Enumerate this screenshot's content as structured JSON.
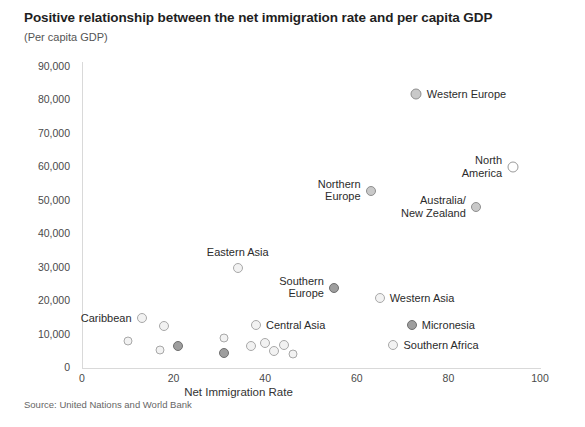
{
  "chart_data": {
    "type": "scatter",
    "title": "Positive relationship between the net immigration rate and per capita GDP",
    "subtitle": "(Per capita GDP)",
    "xlabel": "Net Immigration Rate",
    "ylabel": "",
    "source": "Source: United Nations and World Bank",
    "xlim": [
      0,
      100
    ],
    "ylim": [
      0,
      90000
    ],
    "xticks": [
      "0",
      "20",
      "40",
      "60",
      "80",
      "100"
    ],
    "xtick_values": [
      0,
      20,
      40,
      60,
      80,
      100
    ],
    "yticks": [
      "0",
      "10,000",
      "20,000",
      "30,000",
      "40,000",
      "50,000",
      "60,000",
      "70,000",
      "80,000",
      "90,000"
    ],
    "ytick_values": [
      0,
      10000,
      20000,
      30000,
      40000,
      50000,
      60000,
      70000,
      80000,
      90000
    ],
    "grid": false,
    "legend": "none",
    "points": [
      {
        "label": "Western Europe",
        "x": 73,
        "y": 82000,
        "shade": "medium",
        "size": 11,
        "label_pos": "right"
      },
      {
        "label": "North\nAmerica",
        "x": 94,
        "y": 60000,
        "shade": "hollow",
        "size": 11,
        "label_pos": "left"
      },
      {
        "label": "Australia/\nNew Zealand",
        "x": 86,
        "y": 48000,
        "shade": "medium",
        "size": 10,
        "label_pos": "left"
      },
      {
        "label": "Northern\nEurope",
        "x": 63,
        "y": 53000,
        "shade": "medium",
        "size": 10,
        "label_pos": "left"
      },
      {
        "label": "Southern\nEurope",
        "x": 55,
        "y": 24000,
        "shade": "dark",
        "size": 10,
        "label_pos": "left"
      },
      {
        "label": "Eastern Asia",
        "x": 34,
        "y": 30000,
        "shade": "light",
        "size": 10,
        "label_pos": "above"
      },
      {
        "label": "Western Asia",
        "x": 65,
        "y": 21000,
        "shade": "light",
        "size": 10,
        "label_pos": "right"
      },
      {
        "label": "Micronesia",
        "x": 72,
        "y": 13000,
        "shade": "dark",
        "size": 10,
        "label_pos": "right"
      },
      {
        "label": "Southern Africa",
        "x": 68,
        "y": 7000,
        "shade": "light",
        "size": 10,
        "label_pos": "right"
      },
      {
        "label": "Caribbean",
        "x": 13,
        "y": 15000,
        "shade": "light",
        "size": 10,
        "label_pos": "left"
      },
      {
        "label": "Central Asia",
        "x": 38,
        "y": 13000,
        "shade": "light",
        "size": 10,
        "label_pos": "right"
      },
      {
        "label": "",
        "x": 18,
        "y": 12500,
        "shade": "light",
        "size": 10,
        "label_pos": "none"
      },
      {
        "label": "",
        "x": 10,
        "y": 8000,
        "shade": "light",
        "size": 9,
        "label_pos": "none"
      },
      {
        "label": "",
        "x": 17,
        "y": 5500,
        "shade": "light",
        "size": 9,
        "label_pos": "none"
      },
      {
        "label": "",
        "x": 21,
        "y": 6500,
        "shade": "dark",
        "size": 10,
        "label_pos": "none"
      },
      {
        "label": "",
        "x": 31,
        "y": 9000,
        "shade": "light",
        "size": 9,
        "label_pos": "none"
      },
      {
        "label": "",
        "x": 31,
        "y": 4500,
        "shade": "dark",
        "size": 10,
        "label_pos": "none"
      },
      {
        "label": "",
        "x": 37,
        "y": 6500,
        "shade": "light",
        "size": 10,
        "label_pos": "none"
      },
      {
        "label": "",
        "x": 40,
        "y": 7500,
        "shade": "light",
        "size": 10,
        "label_pos": "none"
      },
      {
        "label": "",
        "x": 42,
        "y": 5000,
        "shade": "light",
        "size": 10,
        "label_pos": "none"
      },
      {
        "label": "",
        "x": 44,
        "y": 6800,
        "shade": "light",
        "size": 10,
        "label_pos": "none"
      },
      {
        "label": "",
        "x": 46,
        "y": 4200,
        "shade": "light",
        "size": 9,
        "label_pos": "none"
      }
    ]
  }
}
